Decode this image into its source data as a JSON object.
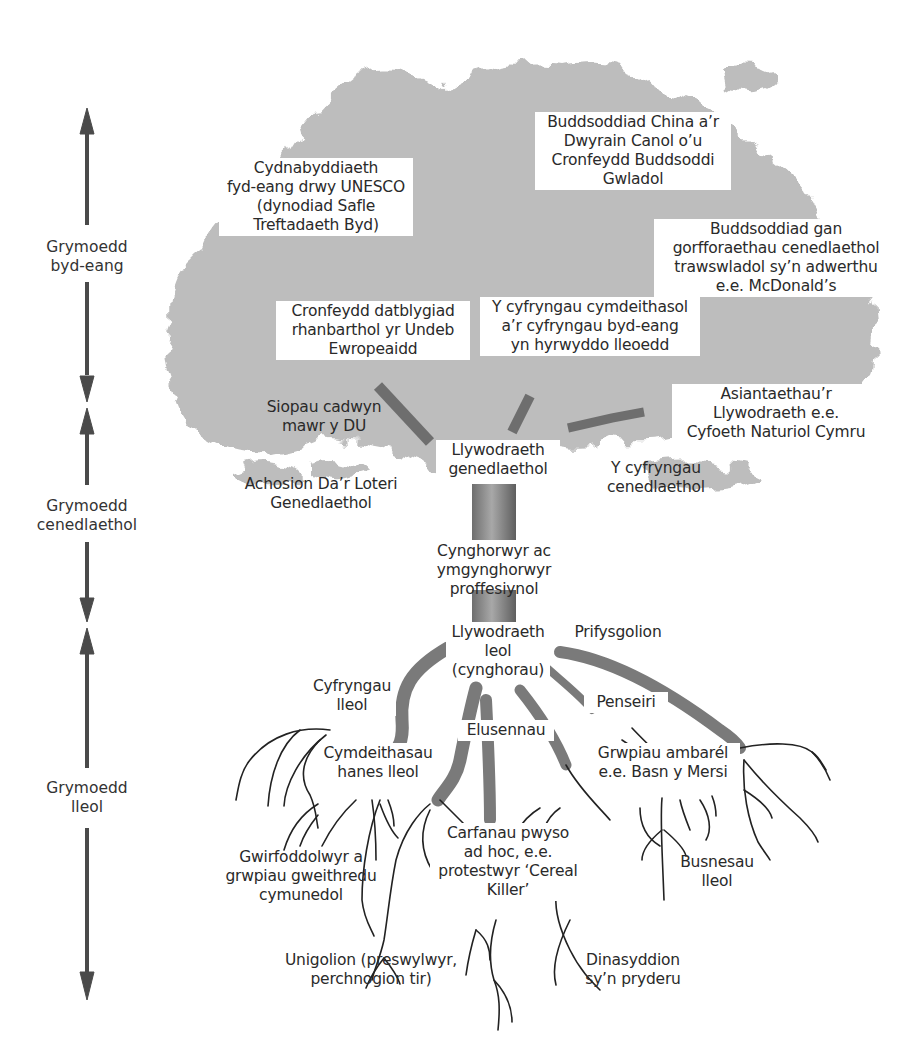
{
  "diagram": {
    "type": "tree-of-influences",
    "colors": {
      "canopy": "#bdbdbd",
      "trunk": "#7a7a7a",
      "roots": "#222222",
      "arrows": "#4a4a4a",
      "background": "#ffffff"
    },
    "scale_axis": {
      "segments": [
        {
          "label": "Grymoedd\nbyd-eang"
        },
        {
          "label": "Grymoedd\ncenedlaethol"
        },
        {
          "label": "Grymoedd\nlleol"
        }
      ]
    },
    "canopy_labels": {
      "unesco": "Cydnabyddiaeth\nfyd-eang drwy UNESCO\n(dynodiad Safle\nTreftadaeth Byd)",
      "china": "Buddsoddiad China a’r\nDwyrain Canol o’u\nCronfeydd Buddsoddi\nGwladol",
      "transnational": "Buddsoddiad gan\ngorfforaethau cenedlaethol\ntrawswladol sy’n adwerthu\ne.e. McDonald’s",
      "eu_fund": "Cronfeydd datblygiad\nrhanbarthol yr Undeb\nEwropeaidd",
      "social_media": "Y cyfryngau cymdeithasol\na’r cyfryngau byd-eang\nyn hyrwyddo lleoedd",
      "chain_stores": "Siopau cadwyn\nmawr y DU",
      "agencies": "Asiantaethau’r\nLlywodraeth e.e.\nCyfoeth Naturiol Cymru",
      "national_gov": "Llywodraeth\ngenedlaethol",
      "lottery": "Achosion Da’r Loteri\nGenedlaethol",
      "national_media": "Y cyfryngau\ncenedlaethol"
    },
    "trunk_labels": {
      "advisers": "Cynghorwyr ac\nymgynghorwyr\nproffesiynol",
      "local_gov": "Llywodraeth\nleol\n(cynghorau)"
    },
    "root_labels": {
      "universities": "Prifysgolion",
      "local_media": "Cyfryngau\nlleol",
      "architects": "Penseiri",
      "charities": "Elusennau",
      "history_societies": "Cymdeithasau\nhanes lleol",
      "umbrella_groups": "Grwpiau ambarél\ne.e. Basn y Mersi",
      "pressure_groups": "Carfanau pwyso\nad hoc, e.e.\nprotestwyr ‘Cereal\nKiller’",
      "volunteers": "Gwirfoddolwyr a\ngrwpiau gweithredu\ncymunedol",
      "local_business": "Busnesau\nlleol",
      "individuals": "Unigolion (preswylwyr,\nperchnogion tir)",
      "concerned_citizens": "Dinasyddion\nsy’n pryderu"
    }
  }
}
